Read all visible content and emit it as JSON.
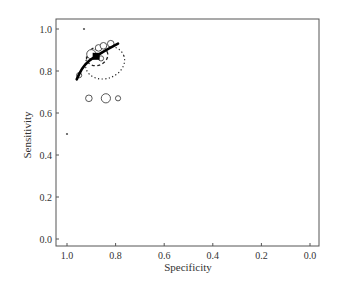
{
  "chart_data": {
    "type": "scatter",
    "title": "",
    "xlabel": "Specificity",
    "ylabel": "Sensitivity",
    "xlim": [
      1.0,
      0.0
    ],
    "ylim": [
      0.0,
      1.0
    ],
    "x_reversed": true,
    "grid": false,
    "legend": null,
    "x_ticks": [
      "1.0",
      "0.8",
      "0.6",
      "0.4",
      "0.2",
      "0.0"
    ],
    "y_ticks": [
      "0.0",
      "0.2",
      "0.4",
      "0.6",
      "0.8",
      "1.0"
    ],
    "study_points": [
      {
        "specificity": 0.93,
        "sensitivity": 1.0,
        "size": "tiny"
      },
      {
        "specificity": 1.0,
        "sensitivity": 0.5,
        "size": "tiny"
      },
      {
        "specificity": 0.95,
        "sensitivity": 0.78,
        "size": "small"
      },
      {
        "specificity": 0.91,
        "sensitivity": 0.67,
        "size": "medium"
      },
      {
        "specificity": 0.84,
        "sensitivity": 0.67,
        "size": "large"
      },
      {
        "specificity": 0.79,
        "sensitivity": 0.67,
        "size": "small"
      },
      {
        "specificity": 0.9,
        "sensitivity": 0.88,
        "size": "large"
      },
      {
        "specificity": 0.87,
        "sensitivity": 0.91,
        "size": "medium"
      },
      {
        "specificity": 0.85,
        "sensitivity": 0.92,
        "size": "medium"
      },
      {
        "specificity": 0.82,
        "sensitivity": 0.93,
        "size": "medium"
      },
      {
        "specificity": 0.86,
        "sensitivity": 0.86,
        "size": "small"
      }
    ],
    "summary_point": {
      "specificity": 0.88,
      "sensitivity": 0.87
    },
    "sroc_curve": [
      {
        "specificity": 0.96,
        "sensitivity": 0.76
      },
      {
        "specificity": 0.94,
        "sensitivity": 0.81
      },
      {
        "specificity": 0.91,
        "sensitivity": 0.85
      },
      {
        "specificity": 0.88,
        "sensitivity": 0.87
      },
      {
        "specificity": 0.84,
        "sensitivity": 0.9
      },
      {
        "specificity": 0.79,
        "sensitivity": 0.93
      }
    ],
    "confidence_region": {
      "center_spec": 0.88,
      "center_sens": 0.87,
      "style": "dashed"
    },
    "prediction_region": {
      "center_spec": 0.86,
      "center_sens": 0.85,
      "style": "dotted"
    }
  }
}
